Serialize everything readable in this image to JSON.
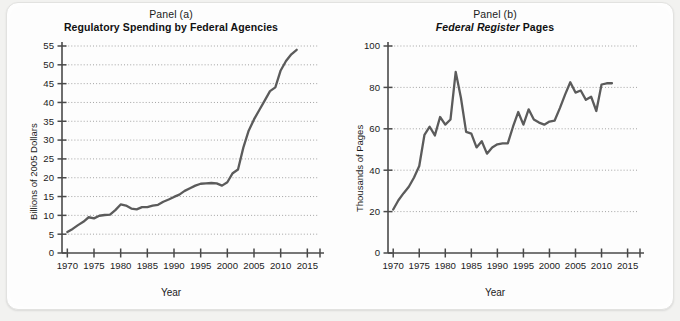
{
  "figure": {
    "background_color": "#f2f2f0",
    "card_color": "#fdfdfd",
    "line_color": "#5b5b5b",
    "axis_color": "#4a4a4a",
    "grid_color": "#9a9a9a",
    "text_color": "#1b1b1b"
  },
  "panel_a": {
    "caption": "Panel (a)",
    "title": "Regulatory Spending by Federal Agencies",
    "title_plain": "Regulatory Spending by Federal Agencies"
  },
  "panel_b": {
    "caption": "Panel (b)",
    "title_italic_part": "Federal Register",
    "title_rest": "Pages",
    "title_plain": "Federal Register Pages"
  },
  "chart_data": [
    {
      "type": "line",
      "id": "panel-a",
      "title": "Regulatory Spending by Federal Agencies",
      "subtitle": "Panel (a)",
      "xlabel": "Year",
      "ylabel": "Billions of 2005 Dollars",
      "xlim": [
        1969,
        2017
      ],
      "ylim": [
        0,
        55
      ],
      "xticks": [
        1970,
        1975,
        1980,
        1985,
        1990,
        1995,
        2000,
        2005,
        2010,
        2015
      ],
      "yticks": [
        0,
        5,
        10,
        15,
        20,
        25,
        30,
        35,
        40,
        45,
        50,
        55
      ],
      "grid": true,
      "grid_style": "dotted-horizontal",
      "legend": null,
      "x": [
        1970,
        1971,
        1972,
        1973,
        1974,
        1975,
        1976,
        1977,
        1978,
        1979,
        1980,
        1981,
        1982,
        1983,
        1984,
        1985,
        1986,
        1987,
        1988,
        1989,
        1990,
        1991,
        1992,
        1993,
        1994,
        1995,
        1996,
        1997,
        1998,
        1999,
        2000,
        2001,
        2002,
        2003,
        2004,
        2005,
        2006,
        2007,
        2008,
        2009,
        2010,
        2011,
        2012,
        2013
      ],
      "values": [
        5.6,
        6.4,
        7.4,
        8.3,
        9.5,
        9.2,
        9.9,
        10.1,
        10.2,
        11.4,
        12.9,
        12.6,
        11.8,
        11.6,
        12.2,
        12.2,
        12.6,
        12.8,
        13.6,
        14.2,
        14.9,
        15.5,
        16.5,
        17.2,
        17.9,
        18.4,
        18.5,
        18.6,
        18.5,
        17.9,
        18.8,
        21.2,
        22.2,
        28.0,
        32.5,
        35.5,
        38.0,
        40.5,
        43.0,
        44.0,
        48.5,
        51.0,
        52.8,
        54.0
      ]
    },
    {
      "type": "line",
      "id": "panel-b",
      "title": "Federal Register Pages",
      "subtitle": "Panel (b)",
      "xlabel": "Year",
      "ylabel": "Thousands of Pages",
      "xlim": [
        1969,
        2017
      ],
      "ylim": [
        0,
        100
      ],
      "xticks": [
        1970,
        1975,
        1980,
        1985,
        1990,
        1995,
        2000,
        2005,
        2010,
        2015
      ],
      "yticks": [
        0,
        20,
        40,
        60,
        80,
        100
      ],
      "grid": true,
      "grid_style": "dotted-horizontal",
      "legend": null,
      "x": [
        1970,
        1971,
        1972,
        1973,
        1974,
        1975,
        1976,
        1977,
        1978,
        1979,
        1980,
        1981,
        1982,
        1983,
        1984,
        1985,
        1986,
        1987,
        1988,
        1989,
        1990,
        1991,
        1992,
        1993,
        1994,
        1995,
        1996,
        1997,
        1998,
        1999,
        2000,
        2001,
        2002,
        2003,
        2004,
        2005,
        2006,
        2007,
        2008,
        2009,
        2010,
        2011,
        2012
      ],
      "values": [
        21.0,
        25.5,
        28.9,
        32.0,
        36.5,
        42.0,
        57.1,
        61.0,
        56.8,
        65.7,
        62.0,
        64.5,
        87.5,
        75.0,
        58.5,
        57.7,
        51.0,
        54.0,
        48.0,
        51.0,
        52.5,
        53.0,
        53.0,
        61.0,
        68.1,
        62.0,
        69.4,
        64.5,
        63.0,
        62.0,
        63.5,
        64.0,
        70.0,
        76.5,
        82.5,
        77.5,
        78.5,
        74.0,
        75.5,
        68.6,
        81.4,
        82.0,
        82.0
      ]
    }
  ]
}
